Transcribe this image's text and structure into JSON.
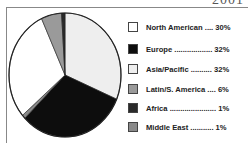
{
  "header": {
    "year": "2001"
  },
  "chart_data": {
    "type": "pie",
    "title": "2001",
    "start_angle": "top, clockwise",
    "slices": [
      {
        "name": "Asia/Pacific",
        "value": 32,
        "color": "#eeeeee"
      },
      {
        "name": "Europe",
        "value": 32,
        "color": "#0d0d0d"
      },
      {
        "name": "Middle East",
        "value": 1,
        "color": "#8a8a8a"
      },
      {
        "name": "North American",
        "value": 30,
        "color": "#ffffff"
      },
      {
        "name": "Latin/S. America",
        "value": 6,
        "color": "#9a9a9a"
      },
      {
        "name": "Africa",
        "value": 1,
        "color": "#2a2a2a"
      }
    ],
    "legend_position": "right"
  },
  "legend": {
    "items": [
      {
        "label": "North American .... 30%",
        "color": "#ffffff"
      },
      {
        "label": "Europe .................. 32%",
        "color": "#0d0d0d"
      },
      {
        "label": "Asia/Pacific .......... 32%",
        "color": "#eeeeee"
      },
      {
        "label": "Latin/S. America .... 6%",
        "color": "#9a9a9a"
      },
      {
        "label": "Africa ...................... 1%",
        "color": "#2a2a2a"
      },
      {
        "label": "Middle East ........... 1%",
        "color": "#8a8a8a"
      }
    ]
  }
}
